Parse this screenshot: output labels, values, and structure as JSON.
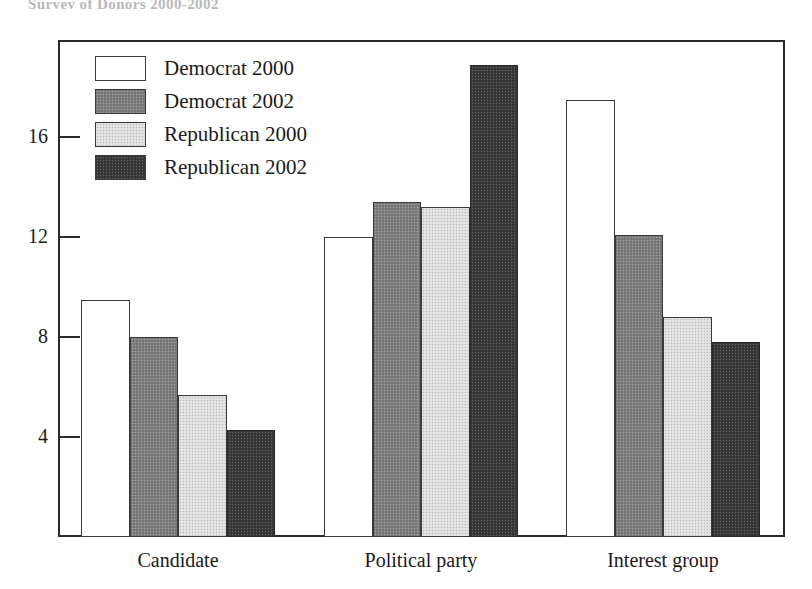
{
  "top_remnant_text": "Survey of Donors 2000-2002",
  "chart_data": {
    "type": "bar",
    "title": "",
    "xlabel": "",
    "ylabel": "",
    "ylim": [
      0,
      19.8
    ],
    "grid": false,
    "legend_position": "top-left inside plot",
    "categories": [
      "Candidate",
      "Political party",
      "Interest group"
    ],
    "yticks": [
      4,
      8,
      12,
      16
    ],
    "ytick_labels": [
      "4",
      "8",
      "12",
      "16"
    ],
    "series": [
      {
        "name": "Democrat 2000",
        "swatch": "white",
        "color": "#ffffff",
        "values": [
          9.5,
          12.0,
          17.5
        ]
      },
      {
        "name": "Democrat 2002",
        "swatch": "mid-gray",
        "color": "#7e7e7e",
        "values": [
          8.0,
          13.4,
          12.1
        ]
      },
      {
        "name": "Republican 2000",
        "swatch": "light-gray",
        "color": "#dedede",
        "values": [
          5.7,
          13.2,
          8.8
        ]
      },
      {
        "name": "Republican 2002",
        "swatch": "dark-gray",
        "color": "#3b3b3b",
        "values": [
          4.3,
          18.9,
          7.8
        ]
      }
    ]
  },
  "colors": {
    "axis": "#2b2b2b",
    "bar_outline": "#3a3a3a",
    "text": "#1a1a1a",
    "background": "#ffffff"
  }
}
